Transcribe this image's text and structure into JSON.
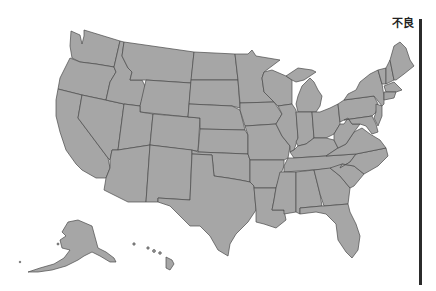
{
  "map": {
    "title": "",
    "region": "United States",
    "fill_color": "#a6a6a6",
    "stroke_color": "#4a4a4a",
    "background": "#ffffff"
  },
  "legend": {
    "label": "不良",
    "bar_color": "#2b2b2b"
  }
}
